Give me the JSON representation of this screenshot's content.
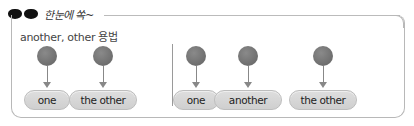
{
  "header": {
    "icon": "sunglasses-icon",
    "title": "한눈에 쏙~"
  },
  "subtitle": "another, other 용법",
  "left_group": {
    "nodes": [
      {
        "label": "one"
      },
      {
        "label": "the other"
      }
    ]
  },
  "right_group": {
    "nodes": [
      {
        "label": "one"
      },
      {
        "label": "another"
      },
      {
        "label": "the other"
      }
    ]
  },
  "colors": {
    "circle": "#767676",
    "pill_bg": "#d6d6d6",
    "pill_border": "#bdbdbd",
    "frame": "#b8b8b8"
  }
}
